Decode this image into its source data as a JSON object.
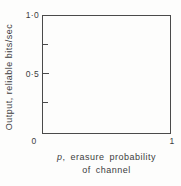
{
  "figure": {
    "xlabel_var": "p",
    "xlabel_rest": ", erasure probability",
    "xlabel_line2": "of channel"
  },
  "colors": {
    "axis_line": "#4a4a4a",
    "text": "#3c3c3c",
    "background": "#fdfdfc"
  },
  "chart_data": {
    "type": "line",
    "title": "",
    "xlabel": "p, erasure probability of channel",
    "ylabel": "Output, reliable bits/sec",
    "xlim": [
      0,
      1
    ],
    "ylim": [
      0,
      1.0
    ],
    "xticks": [
      0,
      1
    ],
    "yticks": [
      0,
      0.5,
      1.0
    ],
    "y_minor_ticks": [
      0.25,
      0.75
    ],
    "xtick_labels": [
      "0",
      "1"
    ],
    "ytick_labels": [
      "0",
      "0·5",
      "1·0"
    ],
    "grid": false,
    "legend": false,
    "frame": "full-box",
    "series": []
  }
}
